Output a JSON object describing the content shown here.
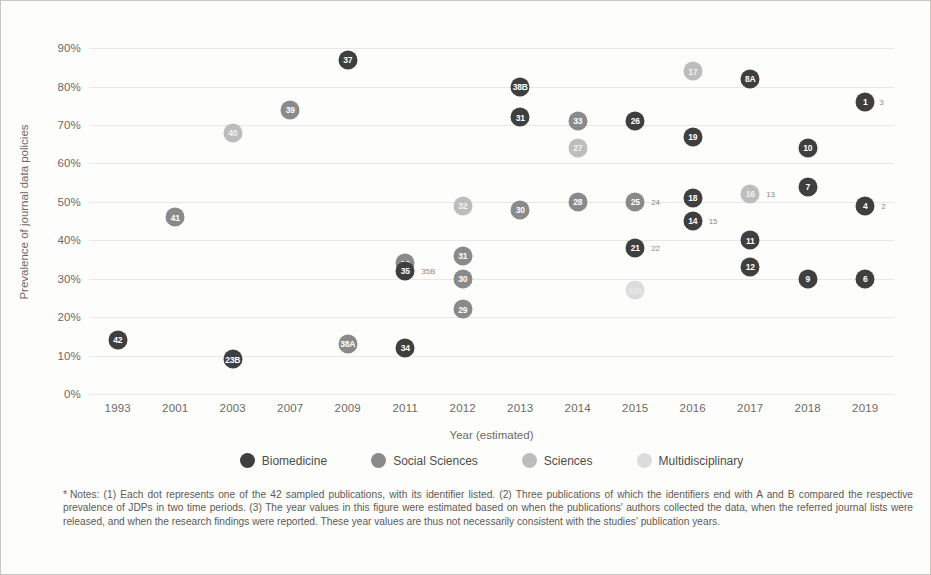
{
  "axes": {
    "ylabel": "Prevalence of journal data policies",
    "xlabel": "Year (estimated)",
    "yticks": [
      "0%",
      "10%",
      "20%",
      "30%",
      "40%",
      "50%",
      "60%",
      "70%",
      "80%",
      "90%"
    ],
    "xticks": [
      "1993",
      "2001",
      "2003",
      "2007",
      "2009",
      "2011",
      "2012",
      "2013",
      "2014",
      "2015",
      "2016",
      "2017",
      "2018",
      "2019"
    ]
  },
  "legend": {
    "items": [
      {
        "label": "Biomedicine",
        "color": "#3f3f3f",
        "key": "bio"
      },
      {
        "label": "Social Sciences",
        "color": "#8a8a8a",
        "key": "soc"
      },
      {
        "label": "Sciences",
        "color": "#bdbdbd",
        "key": "sci"
      },
      {
        "label": "Multidisciplinary",
        "color": "#dcdcdc",
        "key": "mul"
      }
    ]
  },
  "notes": {
    "marker": "*",
    "text": "Notes: (1) Each dot represents one of the 42 sampled publications, with its identifier listed. (2) Three publications of which the identifiers end with A and B compared the respective prevalence of JDPs in two time periods. (3) The year values in this figure were estimated based on when the publications' authors collected the data, when the referred journal lists were released, and when the research findings were reported. These year values are thus not necessarily consistent with the studies' publication years."
  },
  "chart_data": {
    "type": "scatter",
    "title": "",
    "xlabel": "Year (estimated)",
    "ylabel": "Prevalence of journal data policies",
    "ylim": [
      0,
      95
    ],
    "yticks": [
      0,
      10,
      20,
      30,
      40,
      50,
      60,
      70,
      80,
      90
    ],
    "x_categories": [
      "1993",
      "2001",
      "2003",
      "2007",
      "2009",
      "2011",
      "2012",
      "2013",
      "2014",
      "2015",
      "2016",
      "2017",
      "2018",
      "2019"
    ],
    "grid": "horizontal",
    "legend_position": "bottom",
    "series": [
      {
        "name": "Biomedicine",
        "color": "#3f3f3f"
      },
      {
        "name": "Social Sciences",
        "color": "#8a8a8a"
      },
      {
        "name": "Sciences",
        "color": "#bdbdbd"
      },
      {
        "name": "Multidisciplinary",
        "color": "#dcdcdc"
      }
    ],
    "points": [
      {
        "id": "42",
        "year": "1993",
        "value": 14,
        "series": "Biomedicine",
        "label": "",
        "dx": 0
      },
      {
        "id": "41",
        "year": "2001",
        "value": 46,
        "series": "Social Sciences",
        "label": "",
        "dx": 0
      },
      {
        "id": "23B",
        "year": "2003",
        "value": 9,
        "series": "Biomedicine",
        "label": "",
        "dx": 0
      },
      {
        "id": "40",
        "year": "2003",
        "value": 68,
        "series": "Sciences",
        "label": "",
        "dx": 0
      },
      {
        "id": "39",
        "year": "2007",
        "value": 74,
        "series": "Social Sciences",
        "label": "",
        "dx": 0
      },
      {
        "id": "37",
        "year": "2009",
        "value": 87,
        "series": "Biomedicine",
        "label": "",
        "dx": 0
      },
      {
        "id": "38A",
        "year": "2009",
        "value": 13,
        "series": "Social Sciences",
        "label": "",
        "dx": 0
      },
      {
        "id": "36",
        "year": "2011",
        "value": 34,
        "series": "Social Sciences",
        "label": "",
        "dx": 0
      },
      {
        "id": "35",
        "year": "2011",
        "value": 32,
        "series": "Biomedicine",
        "label": "35B",
        "dx": 16
      },
      {
        "id": "34",
        "year": "2011",
        "value": 12,
        "series": "Biomedicine",
        "label": "",
        "dx": 0
      },
      {
        "id": "32",
        "year": "2012",
        "value": 49,
        "series": "Sciences",
        "label": "",
        "dx": 0
      },
      {
        "id": "31",
        "year": "2012",
        "value": 36,
        "series": "Social Sciences",
        "label": "",
        "dx": 0
      },
      {
        "id": "30",
        "year": "2012",
        "value": 30,
        "series": "Social Sciences",
        "label": "",
        "dx": 0
      },
      {
        "id": "29",
        "year": "2012",
        "value": 22,
        "series": "Social Sciences",
        "label": "",
        "dx": 0
      },
      {
        "id": "38B",
        "year": "2013",
        "value": 80,
        "series": "Biomedicine",
        "label": "",
        "dx": 0
      },
      {
        "id": "31",
        "year": "2013",
        "value": 72,
        "series": "Biomedicine",
        "label": "",
        "dx": 0
      },
      {
        "id": "30",
        "year": "2013",
        "value": 48,
        "series": "Social Sciences",
        "label": "",
        "dx": 0
      },
      {
        "id": "33",
        "year": "2014",
        "value": 71,
        "series": "Social Sciences",
        "label": "",
        "dx": 0
      },
      {
        "id": "27",
        "year": "2014",
        "value": 64,
        "series": "Sciences",
        "label": "",
        "dx": 0
      },
      {
        "id": "28",
        "year": "2014",
        "value": 50,
        "series": "Social Sciences",
        "label": "",
        "dx": 0
      },
      {
        "id": "26",
        "year": "2015",
        "value": 71,
        "series": "Biomedicine",
        "label": "",
        "dx": 0
      },
      {
        "id": "25",
        "year": "2015",
        "value": 50,
        "series": "Social Sciences",
        "label": "24",
        "dx": 16
      },
      {
        "id": "21",
        "year": "2015",
        "value": 38,
        "series": "Biomedicine",
        "label": "22",
        "dx": 16
      },
      {
        "id": "23A",
        "year": "2015",
        "value": 27,
        "series": "Multidisciplinary",
        "label": "",
        "dx": 0
      },
      {
        "id": "17",
        "year": "2016",
        "value": 84,
        "series": "Sciences",
        "label": "",
        "dx": 0
      },
      {
        "id": "19",
        "year": "2016",
        "value": 67,
        "series": "Biomedicine",
        "label": "",
        "dx": 0
      },
      {
        "id": "18",
        "year": "2016",
        "value": 51,
        "series": "Biomedicine",
        "label": "",
        "dx": 0
      },
      {
        "id": "14",
        "year": "2016",
        "value": 45,
        "series": "Biomedicine",
        "label": "15",
        "dx": 16
      },
      {
        "id": "8A",
        "year": "2017",
        "value": 82,
        "series": "Biomedicine",
        "label": "",
        "dx": 0
      },
      {
        "id": "16",
        "year": "2017",
        "value": 52,
        "series": "Sciences",
        "label": "13",
        "dx": 16
      },
      {
        "id": "11",
        "year": "2017",
        "value": 40,
        "series": "Biomedicine",
        "label": "",
        "dx": 0
      },
      {
        "id": "12",
        "year": "2017",
        "value": 33,
        "series": "Biomedicine",
        "label": "",
        "dx": 0
      },
      {
        "id": "10",
        "year": "2018",
        "value": 64,
        "series": "Biomedicine",
        "label": "",
        "dx": 0
      },
      {
        "id": "7",
        "year": "2018",
        "value": 54,
        "series": "Biomedicine",
        "label": "",
        "dx": 0
      },
      {
        "id": "9",
        "year": "2018",
        "value": 30,
        "series": "Biomedicine",
        "label": "",
        "dx": 0
      },
      {
        "id": "1",
        "year": "2019",
        "value": 76,
        "series": "Biomedicine",
        "label": "3",
        "dx": 14
      },
      {
        "id": "4",
        "year": "2019",
        "value": 49,
        "series": "Biomedicine",
        "label": "2",
        "dx": 16
      },
      {
        "id": "6",
        "year": "2019",
        "value": 30,
        "series": "Biomedicine",
        "label": "",
        "dx": 0
      }
    ]
  }
}
